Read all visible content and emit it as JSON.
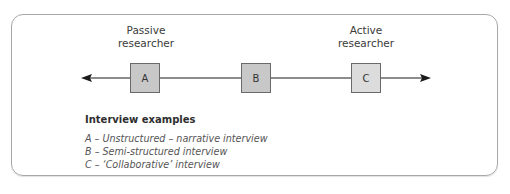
{
  "diagram": {
    "poles": {
      "left": {
        "line1": "Passive",
        "line2": "researcher"
      },
      "right": {
        "line1": "Active",
        "line2": "researcher"
      }
    },
    "boxes": [
      {
        "label": "A",
        "fill": "#c8c8c8"
      },
      {
        "label": "B",
        "fill": "#c8c8c8"
      },
      {
        "label": "C",
        "fill": "#dcdcdc"
      }
    ],
    "axis": {
      "direction": "bidirectional",
      "color": "#1a1a1a"
    },
    "legend": {
      "title": "Interview examples",
      "items": [
        "A – Unstructured – narrative interview",
        "B – Semi-structured interview",
        "C – ‘Collaborative’ interview"
      ]
    }
  }
}
